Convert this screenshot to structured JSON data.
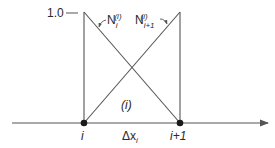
{
  "diagram": {
    "type": "linear-element-shape-functions",
    "y_axis_label": "1.0",
    "element_label": "(i)",
    "element_width_label": "Δx",
    "element_width_sub": "i",
    "nodes": [
      {
        "id": "left",
        "label": "i",
        "x": 84
      },
      {
        "id": "right",
        "label": "i+1",
        "x": 180
      }
    ],
    "shape_functions": [
      {
        "name": "N",
        "sub": "i",
        "sup": "(i)",
        "from": "left-peak"
      },
      {
        "name": "N",
        "sub": "i+1",
        "sup": "(i)",
        "from": "right-peak"
      }
    ],
    "colors": {
      "line": "#555555",
      "text": "#2a2a2a",
      "node": "#1a1a1a"
    }
  }
}
